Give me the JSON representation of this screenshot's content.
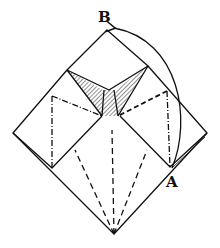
{
  "diagram": {
    "type": "origami-fold-diagram",
    "labels": {
      "top": "B",
      "right": "A"
    },
    "colors": {
      "line": "#111111",
      "background": "#ffffff"
    },
    "arrow": {
      "from": "A",
      "to": "B",
      "style": "curved"
    }
  }
}
